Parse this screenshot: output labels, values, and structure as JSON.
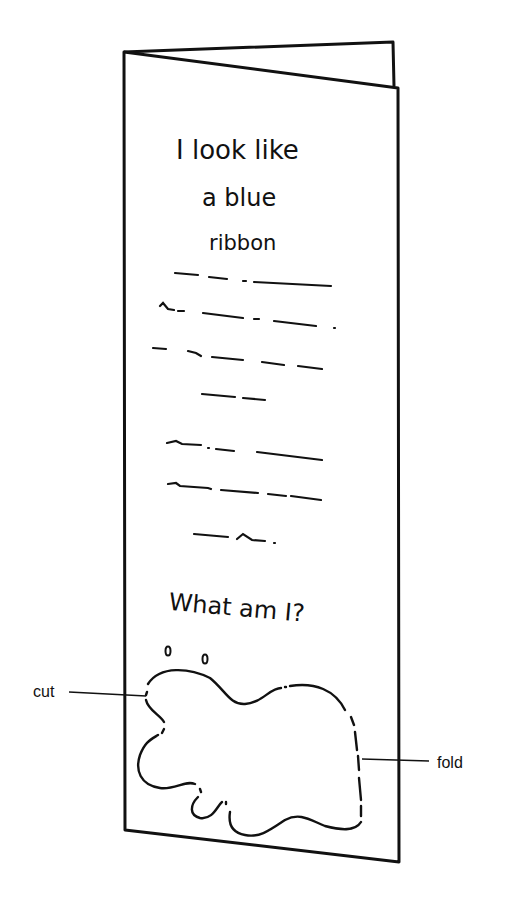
{
  "card": {
    "title_lines": [
      "I look like",
      "a blue",
      "ribbon"
    ],
    "question": "What am I?"
  },
  "annotations": {
    "cut_label": "cut",
    "fold_label": "fold"
  },
  "colors": {
    "ink": "#111111",
    "paper": "#ffffff"
  }
}
